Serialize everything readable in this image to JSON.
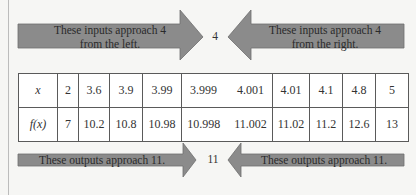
{
  "top": {
    "left_arrow_text": "These inputs approach 4 from the left.",
    "left_line1": "These inputs approach 4",
    "left_line2": "from the left.",
    "center_value": "4",
    "right_line1": "These inputs approach 4",
    "right_line2": "from the right."
  },
  "table": {
    "row_x_label": "x",
    "row_f_label": "f(x)",
    "x_values": [
      "2",
      "3.6",
      "3.9",
      "3.99",
      "3.999",
      "4.001",
      "4.01",
      "4.1",
      "4.8",
      "5"
    ],
    "f_values": [
      "7",
      "10.2",
      "10.8",
      "10.98",
      "10.998",
      "11.002",
      "11.02",
      "11.2",
      "12.6",
      "13"
    ]
  },
  "bottom": {
    "left_text": "These outputs approach 11.",
    "center_value": "11",
    "right_text": "These outputs approach 11."
  },
  "colors": {
    "arrow_fill": "#8a8a8a",
    "arrow_stroke": "#6e6e6e",
    "border": "#5a5a5a"
  }
}
